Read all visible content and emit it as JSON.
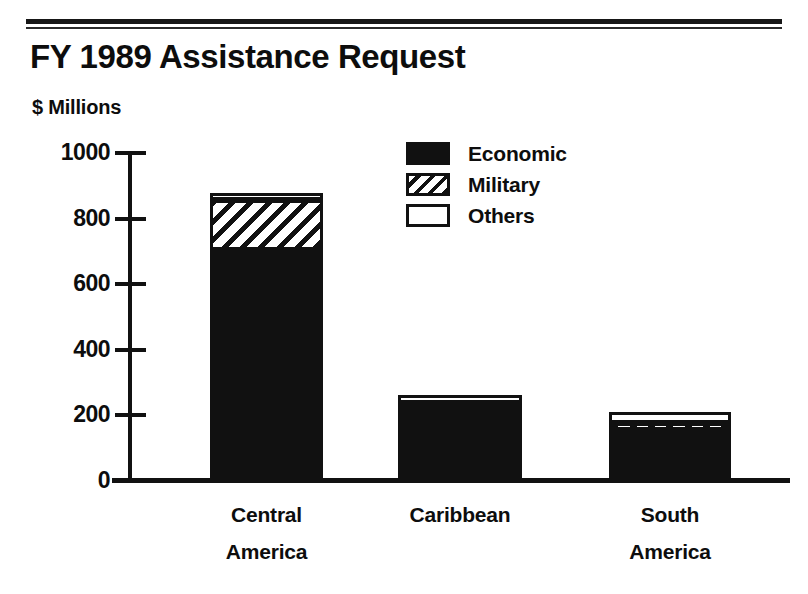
{
  "document": {
    "title": "FY 1989 Assistance Request",
    "subtitle": "$ Millions"
  },
  "chart_data": {
    "type": "bar",
    "subtype": "stacked-bar",
    "title": "FY 1989 Assistance Request",
    "xlabel": "",
    "ylabel": "$ Millions",
    "ylim": [
      0,
      1000
    ],
    "yticks": [
      0,
      200,
      400,
      600,
      800,
      1000
    ],
    "ytick_labels": [
      "0",
      "200",
      "400",
      "600",
      "800",
      "1000"
    ],
    "grid": false,
    "legend_position": "upper-center-right",
    "categories": [
      "Central America",
      "Caribbean",
      "South America"
    ],
    "series": [
      {
        "name": "Economic",
        "fill": "solid-black",
        "values": [
          703,
          218,
          156
        ]
      },
      {
        "name": "Military",
        "fill": "diagonal-hatch",
        "values": [
          153,
          21,
          21
        ]
      },
      {
        "name": "Others",
        "fill": "white-outline",
        "values": [
          21,
          24,
          32
        ]
      }
    ],
    "totals": [
      877,
      263,
      209
    ]
  },
  "axis": {
    "unit_label": "$ Millions",
    "ticks": [
      {
        "value": 1000,
        "label": "1000"
      },
      {
        "value": 800,
        "label": "800"
      },
      {
        "value": 600,
        "label": "600"
      },
      {
        "value": 400,
        "label": "400"
      },
      {
        "value": 200,
        "label": "200"
      },
      {
        "value": 0,
        "label": "0"
      }
    ]
  },
  "categories": [
    {
      "label": "Central\nAmerica",
      "line1": "Central",
      "line2": "America"
    },
    {
      "label": "Caribbean",
      "line1": "Caribbean",
      "line2": ""
    },
    {
      "label": "South\nAmerica",
      "line1": "South",
      "line2": "America"
    }
  ],
  "legend": {
    "items": [
      {
        "label": "Economic",
        "swatch": "solid-black-swatch"
      },
      {
        "label": "Military",
        "swatch": "diagonal-hatch-swatch"
      },
      {
        "label": "Others",
        "swatch": "white-outline-swatch"
      }
    ]
  },
  "colors": {
    "ink": "#111111",
    "paper": "#ffffff"
  }
}
